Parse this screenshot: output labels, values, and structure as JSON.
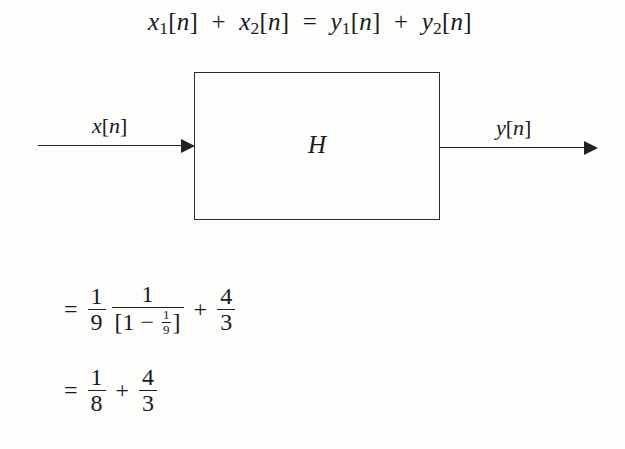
{
  "diagram": {
    "top_equation": {
      "lhs_term1": {
        "base": "x",
        "sub": "1",
        "arg": "[n]"
      },
      "plus1": "+",
      "lhs_term2": {
        "base": "x",
        "sub": "2",
        "arg": "[n]"
      },
      "equals": "=",
      "rhs_term1": {
        "base": "y",
        "sub": "1",
        "arg": "[n]"
      },
      "plus2": "+",
      "rhs_term2": {
        "base": "y",
        "sub": "2",
        "arg": "[n]"
      }
    },
    "block": {
      "label": "H"
    },
    "input": {
      "label_base": "x",
      "label_arg": "[n]"
    },
    "output": {
      "label_base": "y",
      "label_arg": "[n]"
    }
  },
  "derivation": {
    "line1": {
      "equals": "=",
      "frac1": {
        "num": "1",
        "den": "9"
      },
      "frac2": {
        "num": "1",
        "den_open": "[1 − ",
        "den_inner": {
          "num": "1",
          "den": "9"
        },
        "den_close": "]"
      },
      "plus": "+",
      "frac3": {
        "num": "4",
        "den": "3"
      }
    },
    "line2": {
      "equals": "=",
      "frac1": {
        "num": "1",
        "den": "8"
      },
      "plus": "+",
      "frac2": {
        "num": "4",
        "den": "3"
      }
    }
  }
}
